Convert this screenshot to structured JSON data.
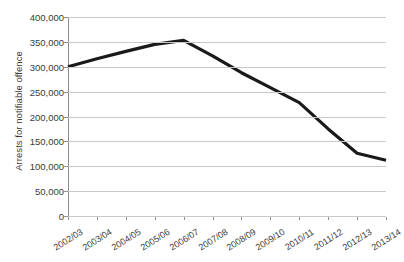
{
  "chart_data": {
    "type": "line",
    "title": "",
    "subtitle": "",
    "xlabel": "",
    "ylabel": "Arrests for notifiable offence",
    "categories": [
      "2002/03",
      "2003/04",
      "2004/05",
      "2005/06",
      "2006/07",
      "2007/08",
      "2008/09",
      "2009/10",
      "2010/11",
      "2011/12",
      "2012/13",
      "2013/14"
    ],
    "values": [
      300000,
      316000,
      331000,
      345000,
      353000,
      322000,
      288000,
      258000,
      228000,
      175000,
      126000,
      112000
    ],
    "series": [
      {
        "name": "Arrests for notifiable offence",
        "values": [
          300000,
          316000,
          331000,
          345000,
          353000,
          322000,
          288000,
          258000,
          228000,
          175000,
          126000,
          112000
        ],
        "color": "#1a1a1a",
        "line_width": 3.2,
        "markers": false
      }
    ],
    "ylim": [
      0,
      400000
    ],
    "yticks": [
      0,
      50000,
      100000,
      150000,
      200000,
      250000,
      300000,
      350000,
      400000
    ],
    "ytick_labels": [
      "0",
      "50,000",
      "100,000",
      "150,000",
      "200,000",
      "250,000",
      "300,000",
      "350,000",
      "400,000"
    ],
    "grid": {
      "horizontal": true,
      "vertical": false,
      "color": "#c9c9c9"
    },
    "legend": {
      "visible": false,
      "position": "none"
    },
    "axis": {
      "line_color": "#8d8d8d",
      "tick_color": "#8d8d8d",
      "label_color": "#3a3a3a",
      "xlabel_rotation": -32
    },
    "background": "#ffffff"
  }
}
